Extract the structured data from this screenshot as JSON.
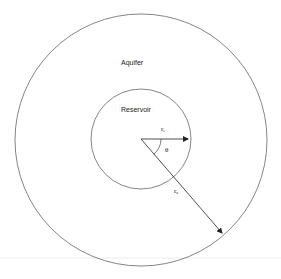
{
  "diagram": {
    "title": "",
    "regions": {
      "outer": {
        "label": "Aquifer"
      },
      "inner": {
        "label": "Reservoir"
      }
    },
    "symbols": {
      "inner_radius": {
        "base": "r",
        "sub": "e"
      },
      "outer_radius": {
        "base": "r",
        "sub": "a"
      },
      "angle": "θ"
    },
    "colors": {
      "stroke": "#555555",
      "arrow": "#222222",
      "background": "#ffffff",
      "baseline": "#e8e8e8"
    }
  }
}
